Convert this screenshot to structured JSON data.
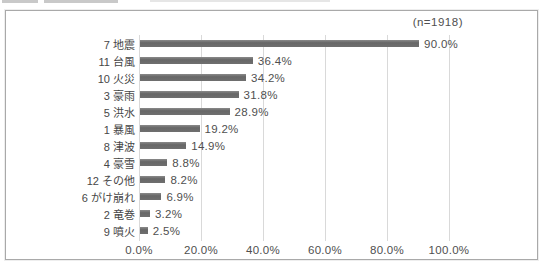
{
  "chart_data": {
    "type": "bar",
    "orientation": "horizontal",
    "title": "",
    "annotation": "(n=1918)",
    "categories": [
      "7 地震",
      "11 台風",
      "10 火災",
      "3 豪雨",
      "5 洪水",
      "1 暴風",
      "8 津波",
      "4 豪雪",
      "12 その他",
      "6 がけ崩れ",
      "2 竜巻",
      "9 噴火"
    ],
    "values": [
      90.0,
      36.4,
      34.2,
      31.8,
      28.9,
      19.2,
      14.9,
      8.8,
      8.2,
      6.9,
      3.2,
      2.5
    ],
    "value_labels": [
      "90.0%",
      "36.4%",
      "34.2%",
      "31.8%",
      "28.9%",
      "19.2%",
      "14.9%",
      "8.8%",
      "8.2%",
      "6.9%",
      "3.2%",
      "2.5%"
    ],
    "x_ticks": [
      "0.0%",
      "20.0%",
      "40.0%",
      "60.0%",
      "80.0%",
      "100.0%"
    ],
    "x_tick_values": [
      0,
      20,
      40,
      60,
      80,
      100
    ],
    "xlim": [
      0,
      100
    ],
    "grid": "vertical",
    "legend": "none",
    "bar_color": "#6f6f6f",
    "gridline_color": "#d9d9d9",
    "text_color": "#4f4f4f"
  }
}
